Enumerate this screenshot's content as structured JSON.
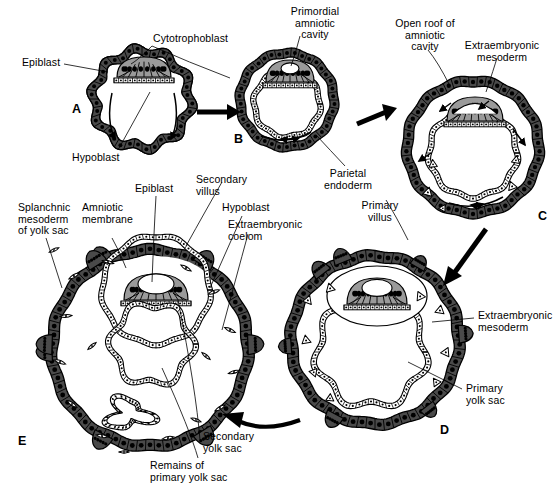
{
  "figure": {
    "domain": "biological-diagram",
    "background_color": "#ffffff",
    "ink_color": "#000000",
    "mesoderm_fill": "#9a9a9a",
    "trophoblast_fill": "#4a4a4a"
  },
  "panels": [
    {
      "id": "A",
      "letter": "A",
      "letter_pos": {
        "x": 72,
        "y": 108
      },
      "stage": "Bilaminar embryonic disc within blastocyst",
      "center": {
        "x": 142,
        "y": 99
      },
      "radius": 52
    },
    {
      "id": "B",
      "letter": "B",
      "letter_pos": {
        "x": 234,
        "y": 138
      },
      "stage": "Primordial amniotic cavity appears",
      "center": {
        "x": 287,
        "y": 100
      },
      "radius": 50
    },
    {
      "id": "C",
      "letter": "C",
      "letter_pos": {
        "x": 538,
        "y": 215
      },
      "stage": "Amniotic cavity roof opens; extraembryonic mesoderm spreads",
      "center": {
        "x": 473,
        "y": 147
      },
      "radius": 70
    },
    {
      "id": "D",
      "letter": "D",
      "letter_pos": {
        "x": 440,
        "y": 429
      },
      "stage": "Primary yolk sac and primary villi",
      "center": {
        "x": 375,
        "y": 340
      },
      "radius": 86
    },
    {
      "id": "E",
      "letter": "E",
      "letter_pos": {
        "x": 18,
        "y": 440
      },
      "stage": "Secondary yolk sac, extraembryonic coelom and secondary villi",
      "center": {
        "x": 150,
        "y": 350
      },
      "radius": 100
    }
  ],
  "labels": [
    {
      "id": "epiblast-a",
      "text": "Epiblast",
      "x": 22,
      "y": 60,
      "align": "l",
      "panel": "A"
    },
    {
      "id": "cytotrophoblast",
      "text": "Cytotrophoblast",
      "x": 153,
      "y": 36,
      "align": "l",
      "panel": "A"
    },
    {
      "id": "hypoblast-a",
      "text": "Hypoblast",
      "x": 72,
      "y": 155,
      "align": "l",
      "panel": "A"
    },
    {
      "id": "primordial-amniotic-cavity",
      "text": "Primordial\namniotic\ncavity",
      "x": 278,
      "y": 8,
      "align": "c",
      "panel": "B"
    },
    {
      "id": "secondary-villus-b",
      "text": "Secondary\nvillus",
      "x": 196,
      "y": 177,
      "align": "l",
      "panel": "E"
    },
    {
      "id": "parietal-endoderm",
      "text": "Parietal\nendoderm",
      "x": 340,
      "y": 170,
      "align": "c",
      "panel": "B"
    },
    {
      "id": "open-roof-amniotic-cavity",
      "text": "Open roof of\namniotic\ncavity",
      "x": 398,
      "y": 20,
      "align": "c",
      "panel": "C"
    },
    {
      "id": "extraembryonic-mesoderm-c",
      "text": "Extraembryonic\nmesoderm",
      "x": 470,
      "y": 42,
      "align": "c",
      "panel": "C"
    },
    {
      "id": "primary-villus",
      "text": "Primary\nvillus",
      "x": 372,
      "y": 203,
      "align": "c",
      "panel": "D"
    },
    {
      "id": "extraembryonic-mesoderm-d",
      "text": "Extraembryonic\nmesoderm",
      "x": 478,
      "y": 313,
      "align": "l",
      "panel": "D"
    },
    {
      "id": "primary-yolk-sac",
      "text": "Primary\nyolk sac",
      "x": 466,
      "y": 386,
      "align": "l",
      "panel": "D"
    },
    {
      "id": "splanchnic-mesoderm-yolk-sac",
      "text": "Splanchnic\nmesoderm\nof yolk sac",
      "x": 18,
      "y": 205,
      "align": "l",
      "panel": "E"
    },
    {
      "id": "amniotic-membrane",
      "text": "Amniotic\nmembrane",
      "x": 82,
      "y": 205,
      "align": "l",
      "panel": "E"
    },
    {
      "id": "epiblast-e",
      "text": "Epiblast",
      "x": 135,
      "y": 186,
      "align": "l",
      "panel": "E"
    },
    {
      "id": "hypoblast-e",
      "text": "Hypoblast",
      "x": 222,
      "y": 205,
      "align": "l",
      "panel": "E"
    },
    {
      "id": "extraembryonic-coelom",
      "text": "Extraembryonic\ncoelom",
      "x": 228,
      "y": 222,
      "align": "l",
      "panel": "E"
    },
    {
      "id": "secondary-yolk-sac",
      "text": "Secondary\nyolk sac",
      "x": 203,
      "y": 434,
      "align": "l",
      "panel": "E"
    },
    {
      "id": "remains-primary-yolk-sac",
      "text": "Remains of\nprimary yolk sac",
      "x": 150,
      "y": 463,
      "align": "l",
      "panel": "E"
    }
  ],
  "arrows": [
    {
      "id": "a-to-b",
      "from": "A",
      "to": "B",
      "kind": "straight-right"
    },
    {
      "id": "b-to-c",
      "from": "B",
      "to": "C",
      "kind": "straight-right-up"
    },
    {
      "id": "c-to-d",
      "from": "C",
      "to": "D",
      "kind": "diagonal-down-left"
    },
    {
      "id": "d-to-e",
      "from": "D",
      "to": "E",
      "kind": "curved-left"
    }
  ]
}
